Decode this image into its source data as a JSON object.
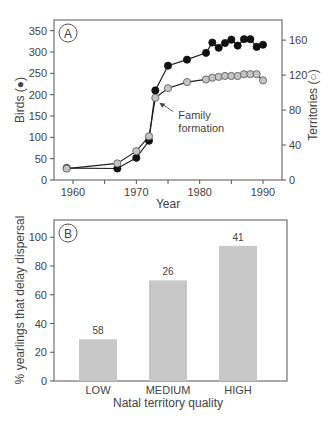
{
  "chart_data": [
    {
      "panel": "A",
      "type": "line",
      "xlabel": "Year",
      "ylabel": "Birds (●)",
      "y2label": "Territories (○)",
      "xticks": [
        "1960",
        "1970",
        "1980",
        "1990"
      ],
      "yticks": [
        "0",
        "50",
        "100",
        "150",
        "200",
        "250",
        "300",
        "350"
      ],
      "y2ticks": [
        "0",
        "40",
        "80",
        "120",
        "160"
      ],
      "xlim": [
        1957,
        1993
      ],
      "ylim": [
        0,
        375
      ],
      "y2lim": [
        0,
        183
      ],
      "annotation": {
        "text": [
          "Family",
          "formation"
        ],
        "x": 1973,
        "y2": 93
      },
      "series": [
        {
          "name": "Birds",
          "axis": "left",
          "marker": "filled",
          "x": [
            1959,
            1967,
            1970,
            1972,
            1973,
            1975,
            1978,
            1981,
            1982,
            1983,
            1984,
            1985,
            1986,
            1987,
            1988,
            1989,
            1990
          ],
          "values": [
            28,
            27,
            52,
            92,
            210,
            268,
            282,
            298,
            322,
            310,
            321,
            329,
            315,
            330,
            330,
            312,
            317
          ]
        },
        {
          "name": "Territories",
          "axis": "right",
          "marker": "open",
          "x": [
            1959,
            1967,
            1970,
            1972,
            1973,
            1975,
            1978,
            1981,
            1982,
            1983,
            1984,
            1985,
            1986,
            1987,
            1988,
            1989,
            1990
          ],
          "values": [
            13,
            19,
            33,
            50,
            94,
            105,
            112,
            115,
            117,
            118,
            119,
            119,
            119,
            121,
            121,
            121,
            114
          ]
        }
      ]
    },
    {
      "panel": "B",
      "type": "bar",
      "categories": [
        "LOW",
        "MEDIUM",
        "HIGH"
      ],
      "values": [
        29,
        70,
        94
      ],
      "bar_labels": [
        "58",
        "26",
        "41"
      ],
      "xlabel": "Natal territory quality",
      "ylabel": "% yearlings that delay dispersal",
      "yticks": [
        "0",
        "20",
        "40",
        "60",
        "80",
        "100"
      ],
      "ylim": [
        0,
        112
      ],
      "bar_color": "#c8c8c8"
    }
  ]
}
